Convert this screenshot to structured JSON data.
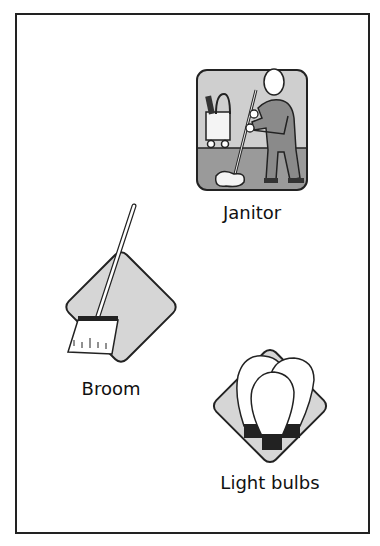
{
  "cards": [
    {
      "id": "janitor",
      "label": "Janitor",
      "icon": "janitor-mopping-icon",
      "shape": "rounded-square"
    },
    {
      "id": "broom",
      "label": "Broom",
      "icon": "broom-icon",
      "shape": "diamond"
    },
    {
      "id": "light-bulbs",
      "label": "Light bulbs",
      "icon": "light-bulbs-icon",
      "shape": "diamond"
    }
  ],
  "colors": {
    "tile_fill": "#d6d6d6",
    "floor_fill": "#9a9a9a",
    "wall_fill": "#cfcfcf",
    "outline": "#1a1a1a",
    "figure_fill": "#8a8a8a"
  }
}
